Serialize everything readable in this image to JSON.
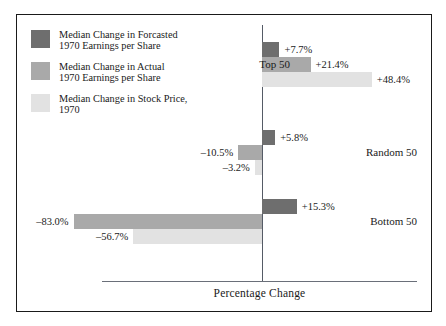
{
  "chart_data": {
    "type": "bar",
    "orientation": "horizontal",
    "title": "",
    "xlabel": "Percentage Change",
    "ylabel": "",
    "grid": false,
    "legend_position": "top-left",
    "zero_reference": 0,
    "xlim": [
      -90,
      55
    ],
    "categories": [
      "Top 50",
      "Random 50",
      "Bottom 50"
    ],
    "series": [
      {
        "name": "Median Change in Forcasted\n1970 Earnings per Share",
        "color": "#6e6e6e",
        "values": [
          7.7,
          5.8,
          15.3
        ],
        "labels": [
          "+7.7%",
          "+5.8%",
          "+15.3%"
        ]
      },
      {
        "name": "Median Change in Actual\n1970 Earnings per Share",
        "color": "#a9a9a9",
        "values": [
          21.4,
          -10.5,
          -83.0
        ],
        "labels": [
          "+21.4%",
          "–10.5%",
          "–83.0%"
        ]
      },
      {
        "name": "Median Change in Stock Price,\n1970",
        "color": "#e2e2e2",
        "values": [
          48.4,
          -3.2,
          -56.7
        ],
        "labels": [
          "+48.4%",
          "–3.2%",
          "–56.7%"
        ]
      }
    ]
  },
  "legend": {
    "items": [
      {
        "label": "Median Change in Forcasted\n1970 Earnings per Share",
        "color": "#6e6e6e"
      },
      {
        "label": "Median Change in Actual\n1970 Earnings per Share",
        "color": "#a9a9a9"
      },
      {
        "label": "Median Change in Stock Price,\n1970",
        "color": "#e2e2e2"
      }
    ]
  },
  "axis": {
    "label": "Percentage Change"
  },
  "groups": [
    {
      "label": "Top 50"
    },
    {
      "label": "Random 50"
    },
    {
      "label": "Bottom 50"
    }
  ],
  "colors": {
    "frame": "#1a1a1a",
    "axis_line": "#555b66",
    "background": "#ffffff",
    "series_dark": "#6e6e6e",
    "series_medium": "#a9a9a9",
    "series_light": "#e2e2e2"
  }
}
